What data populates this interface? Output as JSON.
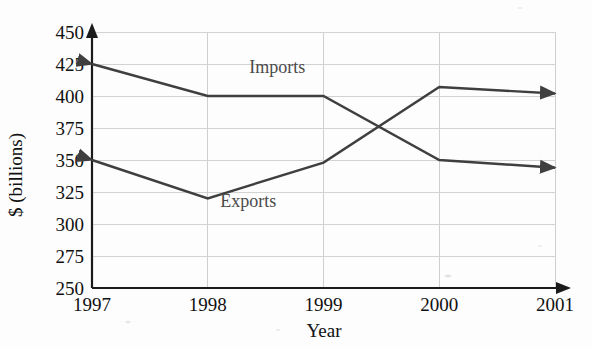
{
  "chart_data": {
    "type": "line",
    "title": "",
    "xlabel": "Year",
    "ylabel": "$ (billions)",
    "categories": [
      "1997",
      "1998",
      "1999",
      "2000",
      "2001"
    ],
    "x": [
      1997,
      1998,
      1999,
      2000,
      2001
    ],
    "ylim": [
      250,
      450
    ],
    "xlim": [
      1997,
      2001
    ],
    "yticks": [
      450,
      425,
      400,
      375,
      350,
      325,
      300,
      275,
      250
    ],
    "ytick_labels": [
      "450",
      "425",
      "400",
      "375",
      "350",
      "325",
      "300",
      "275",
      "250"
    ],
    "xtick_labels": [
      "1997",
      "1998",
      "1999",
      "2000",
      "2001"
    ],
    "grid": "horizontal-and-vertical",
    "legend_position": "inline-on-plot",
    "series": [
      {
        "name": "Imports",
        "color": "#3f3f3f",
        "values": [
          425,
          400,
          400,
          350,
          344
        ],
        "label_x_year": 1998.6,
        "label_y_value": 418
      },
      {
        "name": "Exports",
        "color": "#3f3f3f",
        "values": [
          350,
          320,
          348,
          407,
          402
        ],
        "label_x_year": 1998.35,
        "label_y_value": 313
      }
    ],
    "annotations": [
      "Both series drawn with arrowheads at each end",
      "Lines cross between 1999 and 2000 near 375"
    ]
  },
  "axes": {
    "y_axis_label": "$ (billions)",
    "x_axis_label": "Year",
    "y_axis_arrow": "up-arrow-icon",
    "x_axis_arrow": "right-arrow-icon"
  },
  "colors": {
    "series_stroke": "#3f3f3f",
    "axis": "#1b1b1b",
    "gridline": "#d2d2d2",
    "text": "#111111",
    "series_label_text": "#4a4a4a",
    "background": "#fdfdfd"
  }
}
